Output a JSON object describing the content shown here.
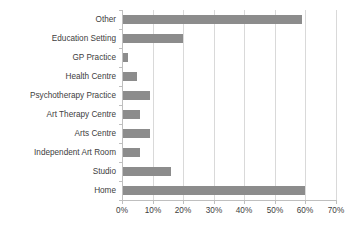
{
  "chart_data": {
    "type": "bar",
    "orientation": "horizontal",
    "title": "",
    "xlabel": "",
    "ylabel": "",
    "categories": [
      "Home",
      "Studio",
      "Independent Art Room",
      "Arts Centre",
      "Art Therapy Centre",
      "Psychotherapy Practice",
      "Health Centre",
      "GP Practice",
      "Education Setting",
      "Other"
    ],
    "values": [
      60,
      16,
      6,
      9,
      6,
      9,
      5,
      2,
      20,
      59
    ],
    "value_suffix": "%",
    "xlim": [
      0,
      70
    ],
    "xticks": [
      0,
      10,
      20,
      30,
      40,
      50,
      60,
      70
    ],
    "xtick_labels": [
      "0%",
      "10%",
      "20%",
      "30%",
      "40%",
      "50%",
      "60%",
      "70%"
    ],
    "grid": true,
    "grid_axis": "x",
    "legend": false,
    "bar_color": "#8c8c8c",
    "gridline_color": "#d9d9d9",
    "axis_color": "#bfbfbf",
    "text_color": "#404040"
  }
}
